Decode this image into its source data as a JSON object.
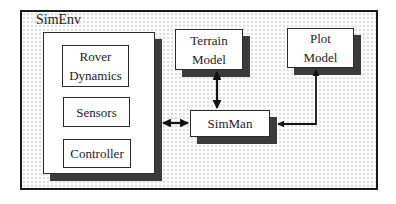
{
  "diagram": {
    "container": {
      "label": "SimEnv"
    },
    "rover_group": {
      "components": [
        {
          "label": "Rover Dynamics",
          "line1": "Rover",
          "line2": "Dynamics"
        },
        {
          "label": "Sensors"
        },
        {
          "label": "Controller"
        }
      ]
    },
    "terrain": {
      "line1": "Terrain",
      "line2": "Model"
    },
    "plot": {
      "line1": "Plot",
      "line2": "Model"
    },
    "simman": {
      "label": "SimMan"
    },
    "connections": [
      {
        "from": "rover_group",
        "to": "SimMan",
        "type": "bidirectional"
      },
      {
        "from": "Terrain Model",
        "to": "SimMan",
        "type": "bidirectional"
      },
      {
        "from": "Plot Model",
        "to": "SimMan",
        "type": "bidirectional"
      }
    ],
    "colors": {
      "border": "#1a1a1a",
      "shadow": "#3a3a3a",
      "box_fill": "#ffffff",
      "dots": "#b9b9b9"
    }
  }
}
